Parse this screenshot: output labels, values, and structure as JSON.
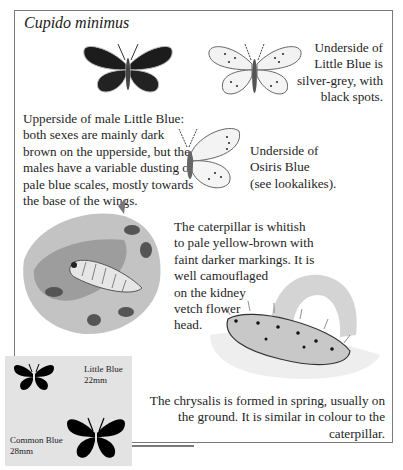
{
  "title": "Cupido minimus",
  "captions": {
    "underside_little_blue": [
      "Underside of",
      "Little Blue is",
      "silver-grey, with",
      "black spots."
    ],
    "upperside_male": [
      "Upperside of male Little Blue:",
      "both sexes are mainly dark",
      "brown on the upperside, but the",
      "males have a variable dusting of",
      "pale blue scales, mostly towards",
      "the base of the wings."
    ],
    "underside_osiris": [
      "Underside of",
      "Osiris Blue",
      "(see lookalikes)."
    ],
    "caterpillar": [
      "The caterpillar is whitish",
      "to pale yellow-brown with",
      "faint darker markings. It is",
      "well camouflaged",
      "on the kidney",
      "vetch flower",
      "head."
    ],
    "chrysalis": [
      "The chrysalis is formed in spring, usually on",
      "the ground. It is similar in colour to the",
      "caterpillar."
    ]
  },
  "size_comparison": {
    "little_blue": {
      "name": "Little Blue",
      "size": "22mm"
    },
    "common_blue": {
      "name": "Common Blue",
      "size": "28mm"
    }
  },
  "illustrations": [
    "butterfly-upperside-male-icon",
    "butterfly-underside-icon",
    "osiris-blue-underside-icon",
    "caterpillar-on-vetch-illustration",
    "chrysalis-illustration",
    "little-blue-silhouette-icon",
    "common-blue-silhouette-icon"
  ],
  "colors": {
    "frame": "#7a7a7a",
    "size_box": "#e3e3e3",
    "ink": "#1e1e1e"
  }
}
